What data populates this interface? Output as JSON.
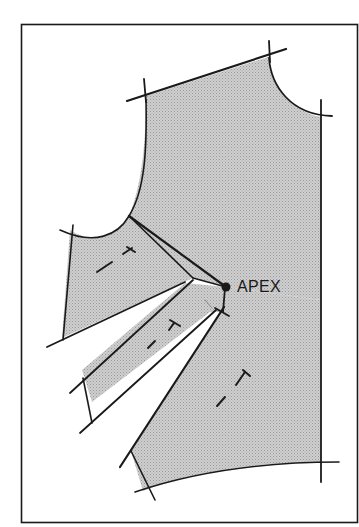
{
  "diagram": {
    "type": "sewing-pattern-bodice-dart-manipulation",
    "labels": {
      "apex": "APEX"
    },
    "colors": {
      "fill": "#c8c8c8",
      "line": "#1a1a1a",
      "background": "#ffffff"
    },
    "elements": [
      "frame-border",
      "bodice-front-shaded-area",
      "shoulder-seam-line",
      "neckline-curve",
      "center-front-line",
      "waistline-curve",
      "armhole-curve",
      "upper-dart-slash",
      "middle-panel-slash",
      "lower-panel-slash",
      "apex-point",
      "grainline-marks"
    ],
    "grainline_marks_count": 3
  }
}
